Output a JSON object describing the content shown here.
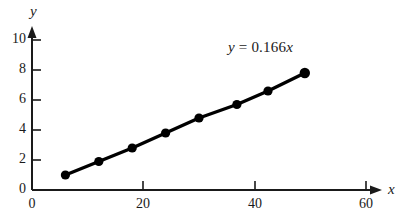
{
  "chart_data": {
    "type": "scatter",
    "title": "",
    "subtitle": "",
    "xlabel": "x",
    "ylabel": "y",
    "x": [
      6,
      12,
      18,
      24,
      30,
      36.8,
      42.4,
      49
    ],
    "y": [
      1.0,
      1.9,
      2.8,
      3.8,
      4.8,
      5.7,
      6.6,
      7.8
    ],
    "series": [
      {
        "name": "data",
        "marker": "filled-circle",
        "line": "solid",
        "color": "#000000",
        "points": [
          {
            "x": 6,
            "y": 1.0
          },
          {
            "x": 12,
            "y": 1.9
          },
          {
            "x": 18,
            "y": 2.8
          },
          {
            "x": 24,
            "y": 3.8
          },
          {
            "x": 30,
            "y": 4.8
          },
          {
            "x": 36.8,
            "y": 5.7
          },
          {
            "x": 42.4,
            "y": 6.6
          },
          {
            "x": 49,
            "y": 7.8
          }
        ]
      }
    ],
    "xlim": [
      0,
      60
    ],
    "ylim": [
      0,
      10
    ],
    "xticks": [
      0,
      20,
      40,
      60
    ],
    "yticks": [
      0,
      2,
      4,
      6,
      8,
      10
    ],
    "xtick_labels": [
      "0",
      "20",
      "40",
      "60"
    ],
    "ytick_labels": [
      "0",
      "2",
      "4",
      "6",
      "8",
      "10"
    ],
    "grid": false,
    "legend": false,
    "legend_position": "none",
    "axis_arrows": true,
    "annotations": [
      {
        "name": "fit-equation",
        "text": "y = 0.166x",
        "parts": {
          "lhs": "y",
          "equals": " = ",
          "coefficient": "0.166",
          "variable": "x"
        },
        "x": 39,
        "y": 9.1
      }
    ],
    "fit": {
      "type": "linear-through-origin",
      "slope": 0.166,
      "intercept": 0
    }
  },
  "axes": {
    "y_axis_label": "y",
    "x_axis_label": "x"
  },
  "colors": {
    "ink": "#1a1a1a",
    "marker": "#000000",
    "line": "#000000",
    "background": "#ffffff"
  }
}
